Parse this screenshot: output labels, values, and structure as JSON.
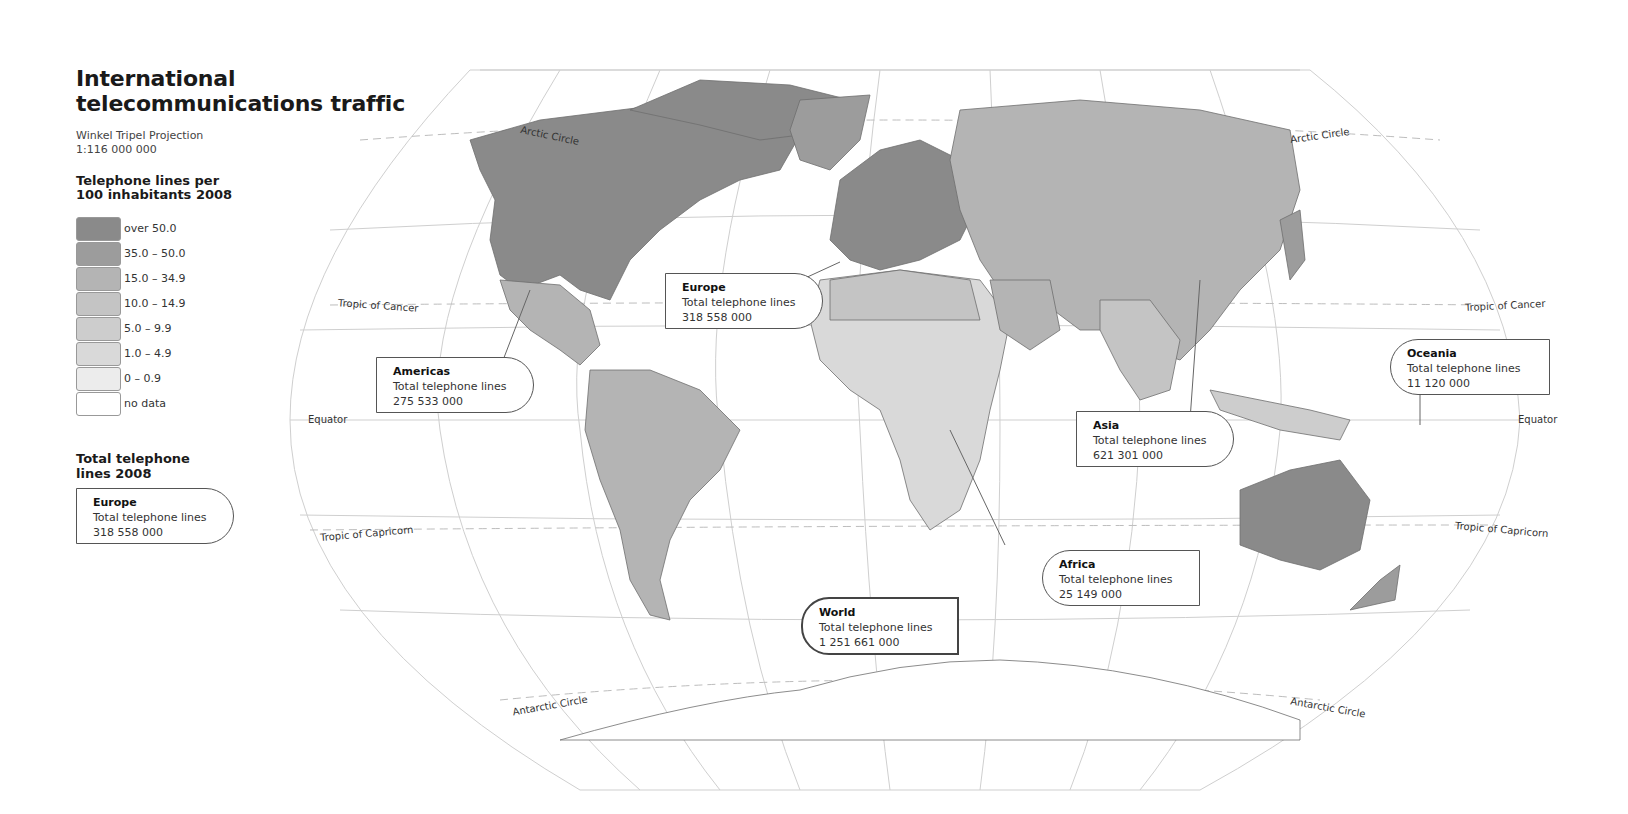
{
  "header": {
    "title_line1": "International",
    "title_line2": "telecommunications traffic",
    "projection": "Winkel Tripel Projection",
    "scale": "1:116 000 000"
  },
  "legend": {
    "title_line1": "Telephone lines per",
    "title_line2": "100 inhabitants 2008",
    "items": [
      {
        "label": "over 50.0",
        "color": "#8a8a8a"
      },
      {
        "label": "35.0 – 50.0",
        "color": "#9c9c9c"
      },
      {
        "label": "15.0 – 34.9",
        "color": "#b4b4b4"
      },
      {
        "label": "10.0 – 14.9",
        "color": "#c4c4c4"
      },
      {
        "label": "5.0 – 9.9",
        "color": "#cdcdcd"
      },
      {
        "label": "1.0 – 4.9",
        "color": "#d9d9d9"
      },
      {
        "label": "0 – 0.9",
        "color": "#ececec"
      },
      {
        "label": "no data",
        "color": "#ffffff"
      }
    ]
  },
  "totals_legend": {
    "title_line1": "Total telephone",
    "title_line2": "lines 2008",
    "example": {
      "region": "Europe",
      "label": "Total telephone lines",
      "value": "318 558 000"
    }
  },
  "regions": {
    "europe": {
      "region": "Europe",
      "label": "Total telephone lines",
      "value": "318 558 000"
    },
    "americas": {
      "region": "Americas",
      "label": "Total telephone lines",
      "value": "275 533 000"
    },
    "asia": {
      "region": "Asia",
      "label": "Total telephone lines",
      "value": "621 301 000"
    },
    "oceania": {
      "region": "Oceania",
      "label": "Total telephone lines",
      "value": "11 120 000"
    },
    "africa": {
      "region": "Africa",
      "label": "Total telephone lines",
      "value": "25 149 000"
    },
    "world": {
      "region": "World",
      "label": "Total telephone lines",
      "value": "1 251 661 000"
    }
  },
  "map_labels": {
    "arctic_circle_left": "Arctic Circle",
    "arctic_circle_right": "Arctic Circle",
    "tropic_cancer_left": "Tropic of Cancer",
    "tropic_cancer_right": "Tropic of Cancer",
    "equator_left": "Equator",
    "equator_right": "Equator",
    "tropic_capricorn_left": "Tropic of Capricorn",
    "tropic_capricorn_right": "Tropic of Capricorn",
    "antarctic_circle_left": "Antarctic Circle",
    "antarctic_circle_right": "Antarctic Circle"
  }
}
